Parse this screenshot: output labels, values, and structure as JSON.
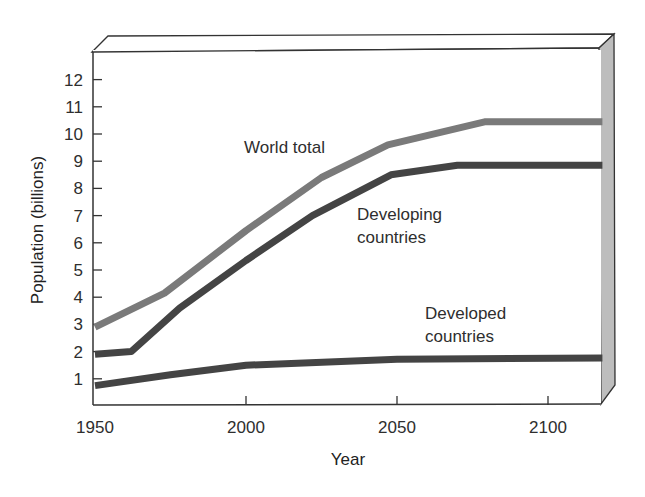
{
  "chart_data": {
    "type": "line",
    "title": "",
    "xlabel": "Year",
    "ylabel": "Population (billions)",
    "xlim": [
      1950,
      2118
    ],
    "ylim": [
      0,
      12.5
    ],
    "x_ticks": [
      1950,
      2000,
      2050,
      2100
    ],
    "y_ticks": [
      1,
      2,
      3,
      4,
      5,
      6,
      7,
      8,
      9,
      10,
      11,
      12
    ],
    "grid": false,
    "legend": "inline labels",
    "series": [
      {
        "name": "World total",
        "label_lines": [
          "World total"
        ],
        "color": "#7a7a7a",
        "x": [
          1950,
          1973,
          2000,
          2025,
          2047,
          2079,
          2118
        ],
        "values": [
          2.9,
          4.15,
          6.45,
          8.4,
          9.6,
          10.45,
          10.45
        ]
      },
      {
        "name": "Developing countries",
        "label_lines": [
          "Developing",
          "countries"
        ],
        "color": "#444444",
        "x": [
          1950,
          1962,
          1978,
          2000,
          2022,
          2048,
          2070,
          2118
        ],
        "values": [
          1.9,
          2.0,
          3.6,
          5.35,
          7.0,
          8.5,
          8.85,
          8.85
        ]
      },
      {
        "name": "Developed countries",
        "label_lines": [
          "Developed",
          "countries"
        ],
        "color": "#444444",
        "x": [
          1950,
          1975,
          2000,
          2050,
          2118
        ],
        "values": [
          0.75,
          1.15,
          1.5,
          1.72,
          1.76
        ]
      }
    ]
  }
}
